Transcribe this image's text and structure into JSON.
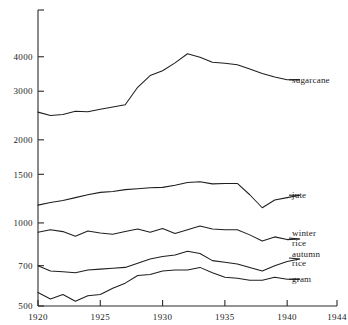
{
  "chart_data": {
    "type": "line",
    "title": "",
    "subtitle": "",
    "xlabel": "",
    "ylabel": "",
    "yscale": "log",
    "xlim": [
      1920,
      1944
    ],
    "ylim": [
      500,
      4600
    ],
    "grid": false,
    "legend_position": "right-direct-labels",
    "yticks": [
      500,
      700,
      1000,
      1500,
      2000,
      3000,
      4000
    ],
    "ytick_labels": [
      "500",
      "700",
      "1000",
      "1500",
      "2000",
      "3000",
      "4000"
    ],
    "xticks": [
      1920,
      1925,
      1930,
      1935,
      1940,
      1944
    ],
    "xtick_labels": [
      "1920",
      "1925",
      "1930",
      "1935",
      "1940",
      "1944"
    ],
    "x": [
      1920,
      1921,
      1922,
      1923,
      1924,
      1925,
      1926,
      1927,
      1928,
      1929,
      1930,
      1931,
      1932,
      1933,
      1934,
      1935,
      1936,
      1937,
      1938,
      1939,
      1940,
      1941
    ],
    "series": [
      {
        "name": "sugarcane",
        "label": "sugarcane",
        "label_lines": [
          "sugarcane"
        ],
        "values": [
          2520,
          2450,
          2470,
          2540,
          2530,
          2580,
          2630,
          2680,
          3100,
          3420,
          3560,
          3800,
          4100,
          3980,
          3820,
          3790,
          3740,
          3610,
          3480,
          3380,
          3300,
          3300
        ]
      },
      {
        "name": "jute",
        "label": "jute",
        "label_lines": [
          "jute"
        ],
        "values": [
          1160,
          1185,
          1205,
          1235,
          1265,
          1290,
          1300,
          1320,
          1330,
          1340,
          1345,
          1370,
          1400,
          1410,
          1385,
          1390,
          1390,
          1265,
          1135,
          1210,
          1235,
          1260
        ]
      },
      {
        "name": "winter-rice",
        "label": "winter rice",
        "label_lines": [
          "winter",
          "rice"
        ],
        "values": [
          925,
          945,
          930,
          895,
          935,
          920,
          910,
          930,
          950,
          925,
          955,
          915,
          945,
          975,
          950,
          945,
          945,
          905,
          860,
          890,
          870,
          875
        ]
      },
      {
        "name": "autumn-rice",
        "label": "autumn rice",
        "label_lines": [
          "autumn",
          "rice"
        ],
        "values": [
          700,
          670,
          665,
          660,
          675,
          680,
          685,
          690,
          715,
          740,
          755,
          765,
          790,
          775,
          730,
          720,
          710,
          690,
          670,
          700,
          725,
          740
        ]
      },
      {
        "name": "gram",
        "label": "gram",
        "label_lines": [
          "gram"
        ],
        "values": [
          560,
          530,
          550,
          520,
          545,
          550,
          580,
          605,
          645,
          650,
          670,
          675,
          675,
          690,
          660,
          635,
          630,
          620,
          620,
          635,
          625,
          625
        ]
      }
    ],
    "colors": {
      "axis": "#2b2b2b",
      "line": "#1f1f1f",
      "background": "#ffffff",
      "text": "#1a1a1a"
    }
  }
}
